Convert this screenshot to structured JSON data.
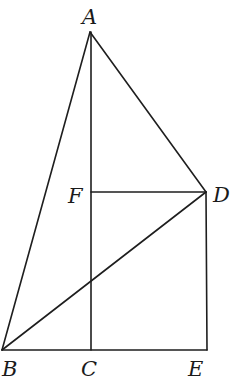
{
  "diagram": {
    "type": "geometry",
    "points": {
      "A": {
        "label": "A",
        "x": 90,
        "y": 32
      },
      "B": {
        "label": "B",
        "x": 2,
        "y": 350
      },
      "C": {
        "label": "C",
        "x": 91,
        "y": 350
      },
      "D": {
        "label": "D",
        "x": 206,
        "y": 192
      },
      "E": {
        "label": "E",
        "x": 207,
        "y": 350
      },
      "F": {
        "label": "F",
        "x": 91,
        "y": 192
      }
    },
    "segments": [
      [
        "A",
        "B"
      ],
      [
        "A",
        "C"
      ],
      [
        "A",
        "D"
      ],
      [
        "B",
        "D"
      ],
      [
        "B",
        "E"
      ],
      [
        "F",
        "D"
      ],
      [
        "D",
        "E"
      ]
    ],
    "labels": {
      "A": "A",
      "B": "B",
      "C": "C",
      "D": "D",
      "E": "E",
      "F": "F"
    }
  }
}
